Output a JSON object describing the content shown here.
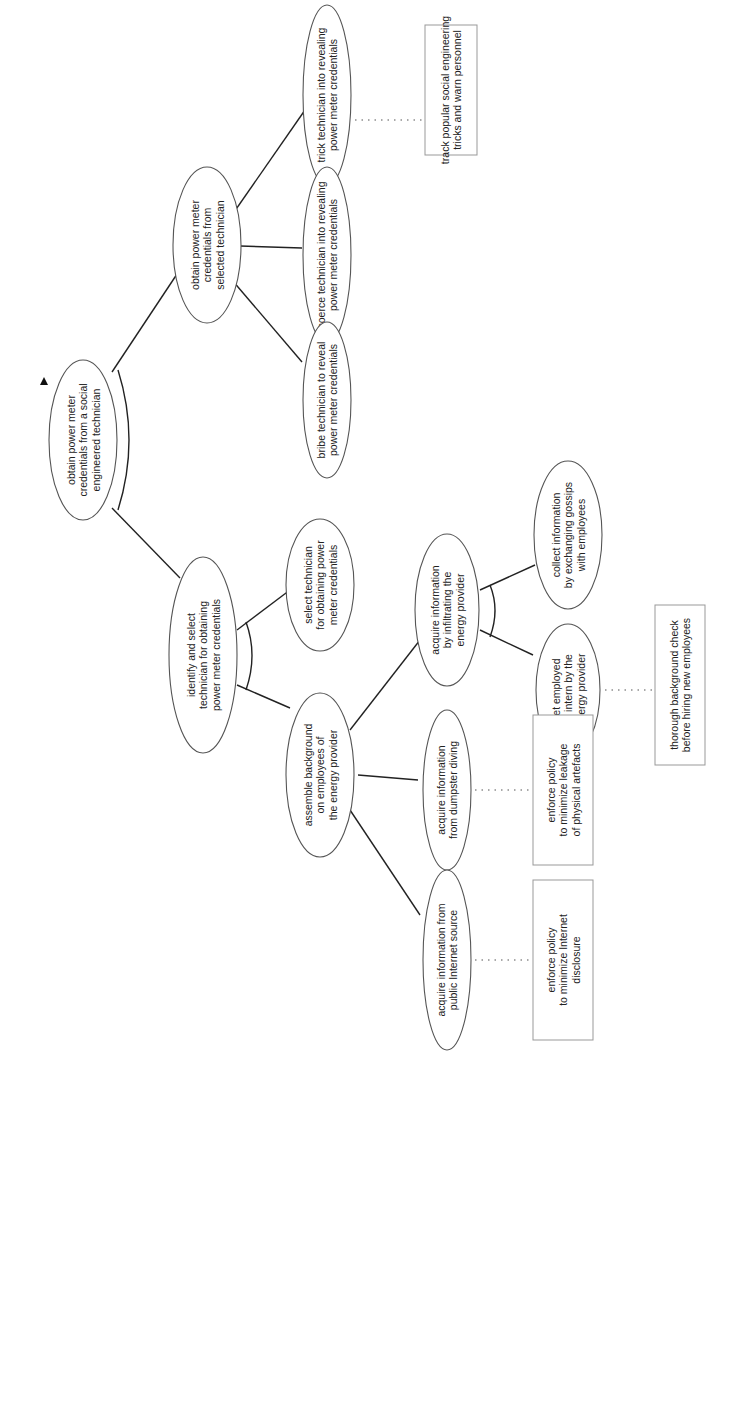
{
  "diagram": {
    "type": "attack-defense tree",
    "orientation": "rotated 90 degrees counter-clockwise",
    "root": {
      "id": "root",
      "lines": [
        "obtain power meter",
        "credentials from a social",
        "engineered technician"
      ],
      "refinement": "conjunctive"
    },
    "attack_nodes": [
      {
        "id": "obtain_selected",
        "lines": [
          "obtain power meter",
          "credentials from",
          "selected technician"
        ],
        "refinement": "disjunctive"
      },
      {
        "id": "trick",
        "lines": [
          "trick technician into revealing",
          "power meter credentials"
        ]
      },
      {
        "id": "coerce",
        "lines": [
          "coerce technician into revealing",
          "power meter credentials"
        ]
      },
      {
        "id": "bribe",
        "lines": [
          "bribe technician to reveal",
          "power meter credentials"
        ]
      },
      {
        "id": "identify",
        "lines": [
          "identify and select",
          "technician for obtaining",
          "power meter credentials"
        ],
        "refinement": "conjunctive"
      },
      {
        "id": "select",
        "lines": [
          "select technician",
          "for obtaining power",
          "meter credentials"
        ]
      },
      {
        "id": "assemble",
        "lines": [
          "assemble background",
          "on employees of",
          "the energy provider"
        ],
        "refinement": "disjunctive"
      },
      {
        "id": "infiltrating",
        "lines": [
          "acquire information",
          "by infiltrating the",
          "energy provider"
        ],
        "refinement": "conjunctive"
      },
      {
        "id": "collect",
        "lines": [
          "collect information",
          "by exchanging gossips",
          "with employees"
        ]
      },
      {
        "id": "employed",
        "lines": [
          "get employed",
          "as intern by the",
          "energy provider"
        ]
      },
      {
        "id": "dumpster",
        "lines": [
          "acquire information",
          "from dumpster diving"
        ]
      },
      {
        "id": "internet",
        "lines": [
          "acquire information from",
          "public Internet source"
        ]
      }
    ],
    "defense_nodes": [
      {
        "id": "track",
        "attached_to": "trick",
        "lines": [
          "track popular social engineering",
          "tricks and warn personnel"
        ]
      },
      {
        "id": "background",
        "attached_to": "employed",
        "lines": [
          "thorough background check",
          "before hiring new employees"
        ]
      },
      {
        "id": "leakage",
        "attached_to": "dumpster",
        "lines": [
          "enforce policy",
          "to minimize leakage",
          "of physical artefacts"
        ]
      },
      {
        "id": "disclosure",
        "attached_to": "internet",
        "lines": [
          "enforce policy",
          "to minimize Internet",
          "disclosure"
        ]
      }
    ],
    "colors": {
      "edge": "#222222",
      "ellipse_stroke": "#555555",
      "box_stroke": "#999999",
      "text": "#222222",
      "background": "#ffffff"
    }
  }
}
